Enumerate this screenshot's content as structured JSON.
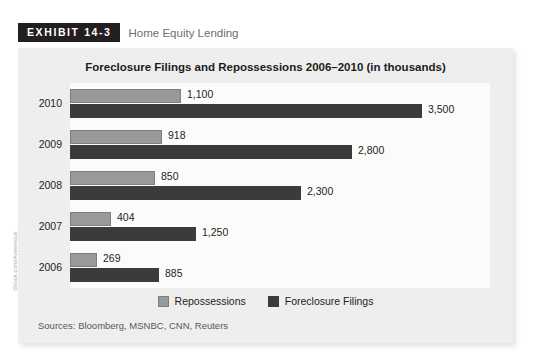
{
  "exhibit": {
    "badge": "EXHIBIT 14-3",
    "title": "Home Equity Lending"
  },
  "credit": "iStock.com/Aveemous",
  "sources": "Sources: Bloomberg, MSNBC, CNN, Reuters",
  "colors": {
    "repossessions": "#999999",
    "foreclosure_filings": "#3b3b3b",
    "panel_bg": "#eeeeee",
    "plot_bg": "#fbfbfb",
    "badge_bg": "#231f20",
    "text": "#231f20"
  },
  "chart_data": {
    "type": "bar",
    "orientation": "horizontal",
    "title": "Foreclosure Filings and Repossessions 2006–2010 (in thousands)",
    "xlabel": "",
    "ylabel": "",
    "grid": false,
    "legend_position": "bottom",
    "xlim": [
      0,
      3500
    ],
    "categories": [
      "2010",
      "2009",
      "2008",
      "2007",
      "2006"
    ],
    "series": [
      {
        "name": "Repossessions",
        "color": "#999999",
        "values": [
          1100,
          918,
          850,
          404,
          269
        ],
        "labels": [
          "1,100",
          "918",
          "850",
          "404",
          "269"
        ]
      },
      {
        "name": "Foreclosure Filings",
        "color": "#3b3b3b",
        "values": [
          3500,
          2800,
          2300,
          1250,
          885
        ],
        "labels": [
          "3,500",
          "2,800",
          "2,300",
          "1,250",
          "885"
        ]
      }
    ]
  }
}
